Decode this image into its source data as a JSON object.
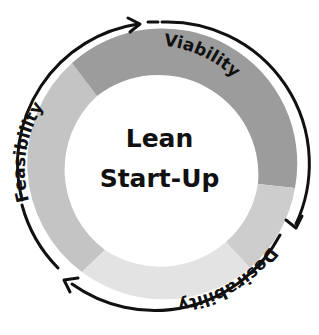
{
  "center": {
    "line1": "Lean",
    "line2": "Start-Up"
  },
  "segments": [
    {
      "label": "Viability",
      "color": "#9c9c9c"
    },
    {
      "label": "Desirability",
      "color": "#dedede"
    },
    {
      "label": "Feasibility",
      "color": "#c4c4c4"
    }
  ],
  "colors": {
    "segment_dark": "#9c9c9c",
    "segment_mid": "#cdcdcd",
    "segment_light": "#e3e3e3",
    "segment_left": "#c4c4c4",
    "arrow": "#111111"
  },
  "arrows": [
    {
      "name": "arrow-top",
      "direction": "clockwise"
    },
    {
      "name": "arrow-right",
      "direction": "clockwise"
    },
    {
      "name": "arrow-left",
      "direction": "clockwise"
    }
  ]
}
